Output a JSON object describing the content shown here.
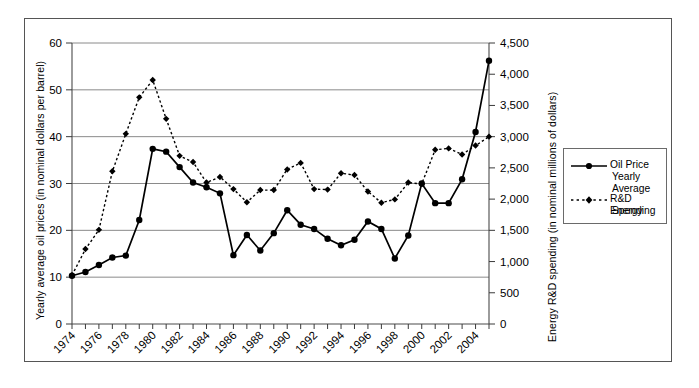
{
  "chart_data": {
    "type": "line",
    "title": "",
    "xlabel": "",
    "ylabel": "Yearly average oil prices (in nominal dollars per barrel)",
    "y2label": "Energy R&D spending (in nominal millions of dollars)",
    "x": [
      1974,
      1975,
      1976,
      1977,
      1978,
      1979,
      1980,
      1981,
      1982,
      1983,
      1984,
      1985,
      1986,
      1987,
      1988,
      1989,
      1990,
      1991,
      1992,
      1993,
      1994,
      1995,
      1996,
      1997,
      1998,
      1999,
      2000,
      2001,
      2002,
      2003,
      2004,
      2005
    ],
    "xtick_labels": [
      "1974",
      "1976",
      "1978",
      "1980",
      "1982",
      "1984",
      "1986",
      "1988",
      "1990",
      "1992",
      "1994",
      "1996",
      "1998",
      "2000",
      "2002",
      "2004"
    ],
    "xtick_values": [
      1974,
      1976,
      1978,
      1980,
      1982,
      1984,
      1986,
      1988,
      1990,
      1992,
      1994,
      1996,
      1998,
      2000,
      2002,
      2004
    ],
    "xlim": [
      1974,
      2005
    ],
    "ylim": [
      0,
      60
    ],
    "ytick_labels": [
      "0",
      "10",
      "20",
      "30",
      "40",
      "50",
      "60"
    ],
    "ytick_values": [
      0,
      10,
      20,
      30,
      40,
      50,
      60
    ],
    "y2lim": [
      0,
      4500
    ],
    "y2tick_labels": [
      "0",
      "500",
      "1,000",
      "1,500",
      "2,000",
      "2,500",
      "3,000",
      "3,500",
      "4,000",
      "4,500"
    ],
    "y2tick_values": [
      0,
      500,
      1000,
      1500,
      2000,
      2500,
      3000,
      3500,
      4000,
      4500
    ],
    "grid": "horizontal",
    "legend_position": "right-outside",
    "series": [
      {
        "name": "Oil Price Yearly Average",
        "legend_label": "Oil Price\nYearly Average",
        "axis": "left",
        "style": "solid",
        "marker": "circle",
        "color": "#000000",
        "values": [
          10.3,
          11.1,
          12.6,
          14.2,
          14.6,
          22.2,
          37.4,
          36.8,
          33.5,
          30.2,
          29.2,
          27.9,
          14.7,
          19.0,
          15.7,
          19.4,
          24.3,
          21.2,
          20.3,
          18.2,
          16.8,
          18.0,
          21.9,
          20.3,
          14.0,
          18.9,
          30.0,
          25.8,
          25.8,
          30.9,
          41.0,
          56.2
        ]
      },
      {
        "name": "R&D Energy Spending",
        "legend_label": "R&D Energy\nSpending",
        "axis": "right",
        "style": "dotted",
        "marker": "diamond",
        "color": "#000000",
        "values_left_scale": [
          10.4,
          16.0,
          20.1,
          32.6,
          40.6,
          48.4,
          52.1,
          43.8,
          35.9,
          34.6,
          30.2,
          31.4,
          28.8,
          26.0,
          28.6,
          28.6,
          33.0,
          34.4,
          28.8,
          28.7,
          32.2,
          31.8,
          28.3,
          25.9,
          26.6,
          30.2,
          29.9,
          37.2,
          37.5,
          36.2,
          38.1,
          40.0
        ],
        "values": [
          780,
          1200,
          1508,
          2445,
          3045,
          3630,
          3908,
          3285,
          2693,
          2595,
          2265,
          2355,
          2160,
          1950,
          2145,
          2145,
          2475,
          2580,
          2160,
          2153,
          2415,
          2385,
          2123,
          1943,
          1995,
          2265,
          2243,
          2790,
          2813,
          2715,
          2858,
          3000
        ]
      }
    ]
  },
  "axes": {
    "left_title": "Yearly average oil prices (in nominal dollars per barrel)",
    "right_title": "Energy R&D spending (in nominal millions of dollars)"
  },
  "legend": {
    "items": [
      {
        "label_line1": "Oil Price",
        "label_line2": "Yearly Average",
        "marker": "circle-solid-line"
      },
      {
        "label_line1": "R&D Energy",
        "label_line2": "Spending",
        "marker": "diamond-dotted-line"
      }
    ]
  }
}
